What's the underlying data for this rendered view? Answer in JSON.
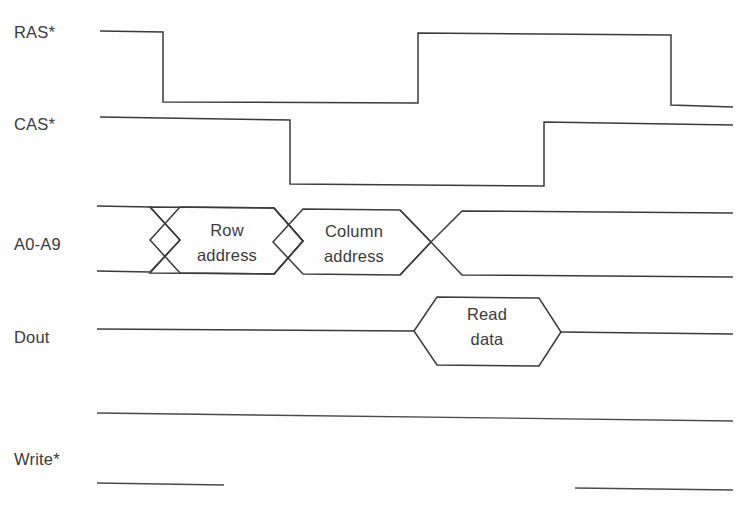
{
  "diagram": {
    "background_color": "#fefefe",
    "line_color": "#3b3b3b",
    "text_color": "#3a3a3a",
    "signals": [
      {
        "name": "ras",
        "label": "RAS*",
        "label_x": 14,
        "label_y": 38,
        "type": "digital",
        "high_y": 31,
        "low_y": 102,
        "start_x": 100,
        "end_x": 733,
        "transitions": [
          {
            "x": 163,
            "to": "low"
          },
          {
            "x": 418,
            "to": "high"
          },
          {
            "x": 671,
            "to": "low"
          }
        ]
      },
      {
        "name": "cas",
        "label": "CAS*",
        "label_x": 14,
        "label_y": 130,
        "type": "digital",
        "high_y": 117,
        "low_y": 184,
        "start_x": 100,
        "end_x": 733,
        "transitions": [
          {
            "x": 290,
            "to": "low"
          },
          {
            "x": 544,
            "to": "high"
          }
        ]
      },
      {
        "name": "a0-a9",
        "label": "A0-A9",
        "label_x": 14,
        "label_y": 250,
        "type": "bus",
        "top_y": 205,
        "bottom_y": 272,
        "start_x": 97,
        "end_x": 733,
        "crossings": [
          164,
          288,
          417
        ],
        "bevel": 17,
        "cells": [
          {
            "label_line1": "Row",
            "label_line2": "address",
            "center_x": 227,
            "line1_y": 236,
            "line2_y": 261
          },
          {
            "label_line1": "Column",
            "label_line2": "address",
            "center_x": 353,
            "line1_y": 236,
            "line2_y": 261
          }
        ]
      },
      {
        "name": "dout",
        "label": "Dout",
        "label_x": 14,
        "label_y": 343,
        "type": "data-valid",
        "mid_y": 331,
        "top_y": 297,
        "bottom_y": 365,
        "start_x": 97,
        "end_x": 733,
        "valid_left_x": 414,
        "valid_right_x": 561,
        "bevel": 17,
        "cells": [
          {
            "label_line1": "Read",
            "label_line2": "data",
            "center_x": 487,
            "line1_y": 320,
            "line2_y": 345
          }
        ]
      },
      {
        "name": "write",
        "label": "Write*",
        "label_x": 14,
        "label_y": 465,
        "type": "segments",
        "segments": [
          {
            "name": "write-high-line",
            "x1": 97,
            "y1": 413,
            "x2": 733,
            "y2": 421
          },
          {
            "name": "write-low-line-left",
            "x1": 97,
            "y1": 483,
            "x2": 224,
            "y2": 485
          },
          {
            "name": "write-low-line-right",
            "x1": 575,
            "y1": 488,
            "x2": 733,
            "y2": 490
          }
        ]
      }
    ]
  }
}
